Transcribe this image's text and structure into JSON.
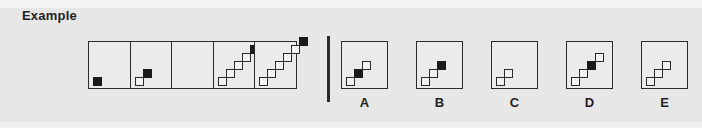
{
  "title": "Example",
  "colors": {
    "background": "#e7e7e7",
    "ink": "#231f20",
    "stroke": "#2b2b2b",
    "filled_square": "#1a1a1a",
    "empty_square": "#f2f2f2"
  },
  "puzzle": {
    "type": "figural-matrix-sequence",
    "square_size_px": 9,
    "step_px": 8,
    "sequence": {
      "name": "sequence-strip",
      "cell_count": 5,
      "cells": [
        {
          "index": 1,
          "name": "sequence-cell-1",
          "square_count": 1,
          "filled_index": 1,
          "squares": [
            {
              "step": 0,
              "fill": "black"
            }
          ]
        },
        {
          "index": 2,
          "name": "sequence-cell-2",
          "square_count": 2,
          "filled_index": 2,
          "squares": [
            {
              "step": 0,
              "fill": "white"
            },
            {
              "step": 1,
              "fill": "black"
            }
          ]
        },
        {
          "index": 3,
          "name": "sequence-cell-3",
          "square_count": 0,
          "filled_index": null,
          "is_missing": true,
          "squares": []
        },
        {
          "index": 4,
          "name": "sequence-cell-4",
          "square_count": 5,
          "filled_index": 5,
          "squares": [
            {
              "step": 0,
              "fill": "white"
            },
            {
              "step": 1,
              "fill": "white"
            },
            {
              "step": 2,
              "fill": "white"
            },
            {
              "step": 3,
              "fill": "white"
            },
            {
              "step": 4,
              "fill": "black"
            }
          ]
        },
        {
          "index": 5,
          "name": "sequence-cell-5",
          "square_count": 6,
          "filled_index": 6,
          "squares": [
            {
              "step": 0,
              "fill": "white"
            },
            {
              "step": 1,
              "fill": "white"
            },
            {
              "step": 2,
              "fill": "white"
            },
            {
              "step": 3,
              "fill": "white"
            },
            {
              "step": 4,
              "fill": "white"
            },
            {
              "step": 5,
              "fill": "black"
            }
          ]
        }
      ]
    },
    "options": [
      {
        "label": "A",
        "name": "option-a",
        "square_count": 3,
        "filled_index": 2,
        "squares": [
          {
            "step": 0,
            "fill": "white"
          },
          {
            "step": 1,
            "fill": "black"
          },
          {
            "step": 2,
            "fill": "white"
          }
        ]
      },
      {
        "label": "B",
        "name": "option-b",
        "square_count": 3,
        "filled_index": 3,
        "squares": [
          {
            "step": 0,
            "fill": "white"
          },
          {
            "step": 1,
            "fill": "white"
          },
          {
            "step": 2,
            "fill": "black"
          }
        ]
      },
      {
        "label": "C",
        "name": "option-c",
        "square_count": 2,
        "filled_index": null,
        "squares": [
          {
            "step": 0,
            "fill": "white"
          },
          {
            "step": 1,
            "fill": "white"
          }
        ]
      },
      {
        "label": "D",
        "name": "option-d",
        "square_count": 4,
        "filled_index": 3,
        "squares": [
          {
            "step": 0,
            "fill": "white"
          },
          {
            "step": 1,
            "fill": "white"
          },
          {
            "step": 2,
            "fill": "black"
          },
          {
            "step": 3,
            "fill": "white"
          }
        ]
      },
      {
        "label": "E",
        "name": "option-e",
        "square_count": 3,
        "filled_index": null,
        "squares": [
          {
            "step": 0,
            "fill": "white"
          },
          {
            "step": 1,
            "fill": "white"
          },
          {
            "step": 2,
            "fill": "white"
          }
        ]
      }
    ]
  }
}
